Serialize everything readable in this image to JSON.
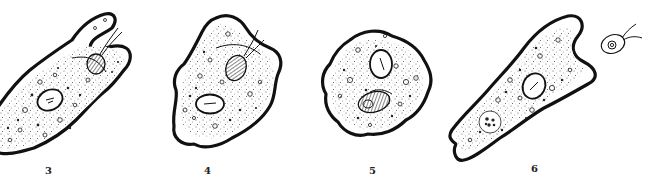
{
  "figure": {
    "panels": [
      {
        "id": "3",
        "label": "3",
        "stage": "pseudopods surrounding flagellate"
      },
      {
        "id": "4",
        "label": "4",
        "stage": "flagellate being enclosed"
      },
      {
        "id": "5",
        "label": "5",
        "stage": "flagellate enclosed in food vacuole"
      },
      {
        "id": "6",
        "label": "6",
        "stage": "digested remains in vacuole; free flagellate nearby"
      }
    ],
    "colors": {
      "ink": "#111111",
      "background": "#ffffff"
    }
  }
}
